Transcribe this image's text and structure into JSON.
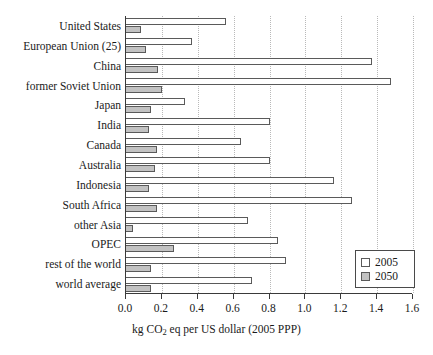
{
  "chart_data": {
    "type": "bar",
    "orientation": "horizontal",
    "title": "",
    "xlabel": "kg CO2 eq per US dollar (2005 PPP)",
    "xlabel_parts": {
      "pre": "kg CO",
      "sub": "2",
      "post": " eq per US dollar (2005 PPP)"
    },
    "ylabel": "",
    "xlim": [
      0.0,
      1.6
    ],
    "xticks": [
      0.0,
      0.2,
      0.4,
      0.6,
      0.8,
      1.0,
      1.2,
      1.4,
      1.6
    ],
    "xticklabels": [
      "0.0",
      "0.2",
      "0.4",
      "0.6",
      "0.8",
      "1.0",
      "1.2",
      "1.4",
      "1.6"
    ],
    "grid": "vertical-dotted",
    "legend_position": "lower-right",
    "categories": [
      "United States",
      "European Union (25)",
      "China",
      "former Soviet Union",
      "Japan",
      "India",
      "Canada",
      "Australia",
      "Indonesia",
      "South Africa",
      "other Asia",
      "OPEC",
      "rest of the world",
      "world average"
    ],
    "series": [
      {
        "name": "2005",
        "color": "#ffffff",
        "values": [
          0.56,
          0.37,
          1.37,
          1.48,
          0.33,
          0.8,
          0.64,
          0.8,
          1.16,
          1.26,
          0.68,
          0.85,
          0.89,
          0.7
        ]
      },
      {
        "name": "2050",
        "color": "#c2c2c2",
        "values": [
          0.085,
          0.11,
          0.18,
          0.2,
          0.14,
          0.13,
          0.175,
          0.16,
          0.13,
          0.175,
          0.04,
          0.27,
          0.14,
          0.14
        ]
      }
    ]
  },
  "legend": {
    "items": [
      {
        "label": "2005",
        "swatch": "white-square"
      },
      {
        "label": "2050",
        "swatch": "gray-square"
      }
    ]
  }
}
